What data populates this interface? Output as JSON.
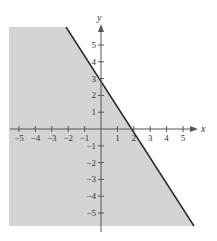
{
  "chart_data": {
    "type": "area",
    "title": "",
    "xlabel": "x",
    "ylabel": "y",
    "xlim": [
      -5.6,
      5.7
    ],
    "ylim": [
      -5.9,
      6.1
    ],
    "x_ticks": [
      -5,
      -4,
      -3,
      -2,
      -1,
      1,
      2,
      3,
      4,
      5
    ],
    "y_ticks": [
      -5,
      -4,
      -3,
      -2,
      -1,
      1,
      2,
      3,
      4,
      5
    ],
    "x_tick_labels": [
      "−5",
      "−4",
      "−3",
      "−2",
      "−1",
      "1",
      "2",
      "3",
      "4",
      "5"
    ],
    "y_tick_labels": [
      "−5",
      "−4",
      "−3",
      "−2",
      "−1",
      "1",
      "2",
      "3",
      "4",
      "5"
    ],
    "grid": false,
    "boundary_line": {
      "equation": "y = -1.5x + 3",
      "slope": -1.5,
      "y_intercept": 3,
      "x_intercept": 2,
      "style": "solid",
      "points": [
        [
          -2,
          6
        ],
        [
          0,
          3
        ],
        [
          2,
          0
        ],
        [
          5.6,
          -5.4
        ]
      ]
    },
    "shaded_region": {
      "side": "below-left",
      "inequality": "3x + 2y <= 6",
      "color": "#d3d3d3"
    },
    "colors": {
      "shade": "#d3d3d3",
      "line": "#222222",
      "axis": "#555555"
    }
  }
}
